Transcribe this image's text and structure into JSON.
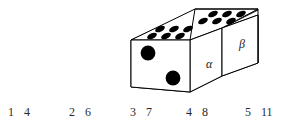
{
  "figure": {
    "stroke_color": "#000000",
    "pip_color": "#000000",
    "face_fill": "#ffffff",
    "background": "#ffffff"
  },
  "block": {
    "front_face": {
      "name": "front-end-face",
      "pip_count": 2,
      "pips": [
        {
          "cx": 146,
          "cy": 50,
          "r": 7.2
        },
        {
          "cx": 173,
          "cy": 76,
          "r": 7.2
        }
      ]
    },
    "top_face_alpha": {
      "name": "top-face-alpha",
      "pip_count": 6,
      "pips": [
        {
          "cx": 149,
          "cy": 37,
          "rx": 5.0,
          "ry": 2.6
        },
        {
          "cx": 163,
          "cy": 37,
          "rx": 5.0,
          "ry": 2.6
        },
        {
          "cx": 177,
          "cy": 37,
          "rx": 5.0,
          "ry": 2.6
        },
        {
          "cx": 158,
          "cy": 30,
          "rx": 5.0,
          "ry": 2.6
        },
        {
          "cx": 172,
          "cy": 30,
          "rx": 5.0,
          "ry": 2.6
        },
        {
          "cx": 186,
          "cy": 30,
          "rx": 5.0,
          "ry": 2.6
        }
      ]
    },
    "top_face_beta": {
      "name": "top-face-beta",
      "pip_count": 6,
      "pips": [
        {
          "cx": 199,
          "cy": 22,
          "rx": 5.0,
          "ry": 2.6
        },
        {
          "cx": 213,
          "cy": 22,
          "rx": 5.0,
          "ry": 2.6
        },
        {
          "cx": 227,
          "cy": 22,
          "rx": 5.0,
          "ry": 2.6
        },
        {
          "cx": 210,
          "cy": 14,
          "rx": 5.0,
          "ry": 2.6
        },
        {
          "cx": 224,
          "cy": 14,
          "rx": 5.0,
          "ry": 2.6
        },
        {
          "cx": 238,
          "cy": 14,
          "rx": 5.0,
          "ry": 2.6
        }
      ]
    },
    "labels": {
      "alpha": "α",
      "beta": "β"
    }
  },
  "numbers": {
    "pairs": [
      {
        "left": "1",
        "right": "4"
      },
      {
        "left": "2",
        "right": "6"
      },
      {
        "left": "3",
        "right": "7"
      },
      {
        "left": "4",
        "right": "8"
      },
      {
        "left": "5",
        "right": "11"
      }
    ]
  }
}
